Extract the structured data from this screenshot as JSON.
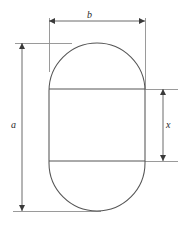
{
  "figure": {
    "shape": {
      "name": "capsule",
      "description": "stadium / rounded-rectangle outline divided into three bands by two horizontal chord lines",
      "stroke_color": "#555555",
      "fill_color": "#ffffff",
      "left": 49,
      "top": 43,
      "right": 145,
      "bottom": 211,
      "corner_radius": 48,
      "divider_lines_y": [
        89,
        161
      ]
    },
    "dimensions": [
      {
        "id": "b",
        "label": "b",
        "orientation": "horizontal",
        "position": "top",
        "from": 49,
        "to": 145,
        "axis": 21,
        "arrows": "both"
      },
      {
        "id": "a",
        "label": "a",
        "orientation": "vertical",
        "position": "left",
        "from": 43,
        "to": 211,
        "axis": 22,
        "arrows": "both"
      },
      {
        "id": "x",
        "label": "x",
        "orientation": "vertical",
        "position": "right",
        "from": 89,
        "to": 161,
        "axis": 163,
        "arrows": "both"
      }
    ],
    "labels": {
      "width_label": "b",
      "height_label": "a",
      "band_height_label": "x"
    },
    "colors": {
      "outline": "#555555",
      "dimension_line": "#5a5a5a",
      "extension_line": "#8a8a8a",
      "text": "#2b2b2b",
      "background": "#ffffff"
    }
  }
}
